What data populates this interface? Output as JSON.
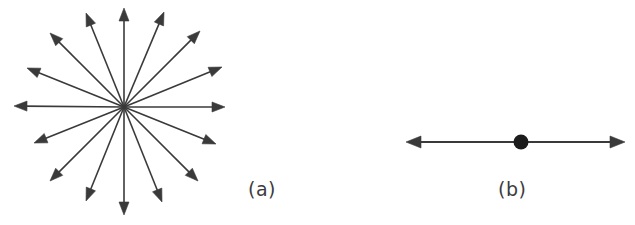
{
  "figure": {
    "background_color": "#ffffff",
    "stroke_color": "#3a3a3a",
    "panels": [
      {
        "id": "panel-a",
        "caption": "(a)",
        "caption_x": 248,
        "caption_y": 178,
        "type": "radial-arrow-burst",
        "description": "isotropic starburst of vectors radiating from a common origin",
        "center": {
          "x": 124,
          "y": 107
        },
        "arrow_count": 16,
        "arrowhead_length": 13,
        "arrowhead_half_width": 5,
        "line_width": 1.6,
        "arrows": [
          {
            "index": 0,
            "angle_deg": 90,
            "length": 99,
            "tip_x": 124,
            "tip_y": 8
          },
          {
            "index": 1,
            "angle_deg": 67,
            "length": 103,
            "tip_x": 164,
            "tip_y": 12
          },
          {
            "index": 2,
            "angle_deg": 45,
            "length": 108,
            "tip_x": 200,
            "tip_y": 31
          },
          {
            "index": 3,
            "angle_deg": 22,
            "length": 106,
            "tip_x": 222,
            "tip_y": 67
          },
          {
            "index": 4,
            "angle_deg": 0,
            "length": 101,
            "tip_x": 225,
            "tip_y": 107
          },
          {
            "index": 5,
            "angle_deg": -22,
            "length": 99,
            "tip_x": 216,
            "tip_y": 144
          },
          {
            "index": 6,
            "angle_deg": -45,
            "length": 104,
            "tip_x": 198,
            "tip_y": 181
          },
          {
            "index": 7,
            "angle_deg": -68,
            "length": 102,
            "tip_x": 162,
            "tip_y": 202
          },
          {
            "index": 8,
            "angle_deg": -90,
            "length": 108,
            "tip_x": 124,
            "tip_y": 215
          },
          {
            "index": 9,
            "angle_deg": -112,
            "length": 101,
            "tip_x": 86,
            "tip_y": 201
          },
          {
            "index": 10,
            "angle_deg": -135,
            "length": 104,
            "tip_x": 50,
            "tip_y": 181
          },
          {
            "index": 11,
            "angle_deg": -158,
            "length": 97,
            "tip_x": 34,
            "tip_y": 143
          },
          {
            "index": 12,
            "angle_deg": 180,
            "length": 110,
            "tip_x": 14,
            "tip_y": 106
          },
          {
            "index": 13,
            "angle_deg": 158,
            "length": 104,
            "tip_x": 27,
            "tip_y": 68
          },
          {
            "index": 14,
            "angle_deg": 135,
            "length": 105,
            "tip_x": 50,
            "tip_y": 33
          },
          {
            "index": 15,
            "angle_deg": 112,
            "length": 101,
            "tip_x": 86,
            "tip_y": 13
          }
        ]
      },
      {
        "id": "panel-b",
        "caption": "(b)",
        "caption_x": 498,
        "caption_y": 178,
        "type": "double-headed-arrow-with-dot",
        "description": "bidirectional axis with a filled marker at the midpoint",
        "axis": {
          "x1": 406,
          "y1": 142,
          "x2": 625,
          "y2": 142,
          "length": 219
        },
        "marker": {
          "x": 521,
          "y": 142,
          "radius": 7.5,
          "fill": "#1c1c1c"
        },
        "arrowhead_length": 15,
        "arrowhead_half_width": 6,
        "line_width": 1.8
      }
    ]
  }
}
